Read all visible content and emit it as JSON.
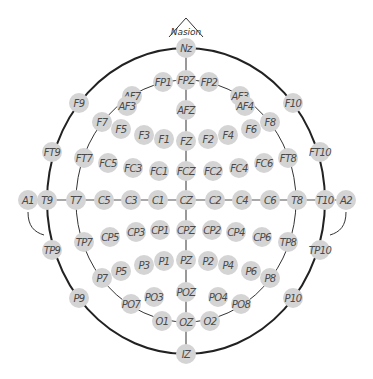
{
  "landmark_label": "Nasion",
  "colors": {
    "node_fill": "#d4d4d4",
    "label_text": "#4a4a4a",
    "outline": "#222222"
  },
  "electrodes": {
    "midline": [
      "Nz",
      "FPZ",
      "AFZ",
      "FZ",
      "FCZ",
      "CZ",
      "CPZ",
      "PZ",
      "POZ",
      "OZ",
      "IZ"
    ],
    "horizontal": [
      "A1",
      "T9",
      "T7",
      "C5",
      "C3",
      "C1",
      "CZ",
      "C2",
      "C4",
      "C6",
      "T8",
      "T10",
      "A2"
    ],
    "outer_ring_left": [
      "F9",
      "FT9",
      "TP9",
      "P9"
    ],
    "outer_ring_right": [
      "F10",
      "FT10",
      "TP10",
      "P10"
    ],
    "inner_ring_left": [
      "FP1",
      "AF7",
      "F7",
      "FT7",
      "TP7",
      "P7",
      "PO7",
      "O1"
    ],
    "inner_ring_right": [
      "FP2",
      "AF3",
      "F8",
      "FT8",
      "TP8",
      "P8",
      "PO8",
      "O2"
    ],
    "grid_left": [
      "AF3",
      "F5",
      "F3",
      "F1",
      "FC5",
      "FC3",
      "FC1",
      "CP5",
      "CP3",
      "CP1",
      "P5",
      "P3",
      "P1",
      "PO3"
    ],
    "grid_right": [
      "AF4",
      "F6",
      "F4",
      "F2",
      "FC6",
      "FC4",
      "FC2",
      "CP6",
      "CP4",
      "CP2",
      "P6",
      "P4",
      "P2",
      "PO4"
    ]
  }
}
